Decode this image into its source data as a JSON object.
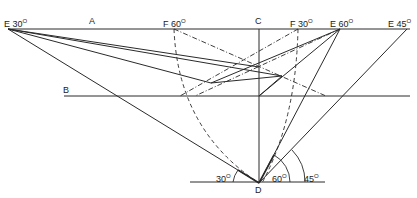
{
  "labels": {
    "e30": {
      "text": "E 30",
      "deg": "O"
    },
    "a": {
      "text": "A"
    },
    "f60": {
      "text": "F 60",
      "deg": "O"
    },
    "c": {
      "text": "C"
    },
    "f30": {
      "text": "F 30",
      "deg": "O"
    },
    "e60": {
      "text": "E 60",
      "deg": "O"
    },
    "e45": {
      "text": "E 45",
      "deg": "O"
    },
    "b": {
      "text": "B"
    },
    "d": {
      "text": "D"
    },
    "ang30": {
      "text": "30",
      "deg": "O"
    },
    "ang60": {
      "text": "60",
      "deg": "O"
    },
    "ang45": {
      "text": "45",
      "deg": "O"
    }
  },
  "colors": {
    "line": "#2a2a2a",
    "background": "#ffffff"
  }
}
